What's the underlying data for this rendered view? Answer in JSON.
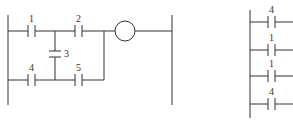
{
  "left_diagram": {
    "contacts": [
      {
        "id": "contact-1",
        "label": "1"
      },
      {
        "id": "contact-2",
        "label": "2"
      },
      {
        "id": "contact-3",
        "label": "3"
      },
      {
        "id": "contact-4",
        "label": "4"
      },
      {
        "id": "contact-5",
        "label": "5"
      }
    ],
    "coil": {
      "label": ""
    }
  },
  "right_diagram": {
    "contacts": [
      {
        "label": "4"
      },
      {
        "label": "1"
      },
      {
        "label": "1"
      },
      {
        "label": "4"
      }
    ]
  },
  "colors": {
    "line": "#333333",
    "background": "#ffffff"
  }
}
